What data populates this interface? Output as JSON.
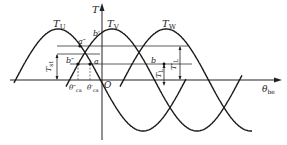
{
  "diagram": {
    "type": "three-phase torque waveforms",
    "axes": {
      "vertical_label": "T",
      "horizontal_label": "θ",
      "horizontal_sub": "be",
      "origin_label": "O"
    },
    "curves": [
      {
        "name": "T",
        "sub": "U",
        "peak_x": 58
      },
      {
        "name": "T",
        "sub": "V",
        "peak_x": 112
      },
      {
        "name": "T",
        "sub": "W",
        "peak_x": 166
      }
    ],
    "points": {
      "a_double_prime": "a″",
      "b_double_prime": "b″",
      "a": "a",
      "b_prime": "b′",
      "b": "b"
    },
    "angle_labels": {
      "theta_ca_double_prime": {
        "base": "θ″",
        "sub": "ca"
      },
      "theta_ca_prime": {
        "base": "θ′",
        "sub": "ca"
      }
    },
    "dimension_labels": {
      "Tst": {
        "base": "T",
        "sub": "st"
      },
      "TL": {
        "base": "T",
        "sub": "L"
      },
      "TL_prime": {
        "base": "T′",
        "sub": "L"
      }
    },
    "colors": {
      "line": "#1a1a1a",
      "guide": "#333333",
      "background": "#ffffff"
    }
  }
}
